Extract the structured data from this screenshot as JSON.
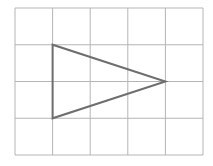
{
  "diagram": {
    "type": "grid-with-triangle",
    "grid": {
      "columns": 5,
      "rows": 4,
      "origin": [
        15,
        8
      ],
      "cell_width": 37.6,
      "cell_height": 36.75,
      "line_color": "#b5b5b5"
    },
    "triangle": {
      "vertices_grid": [
        [
          1,
          1
        ],
        [
          1,
          3
        ],
        [
          4,
          2
        ]
      ],
      "stroke_color": "#6e6e6e",
      "stroke_width": 2
    }
  }
}
